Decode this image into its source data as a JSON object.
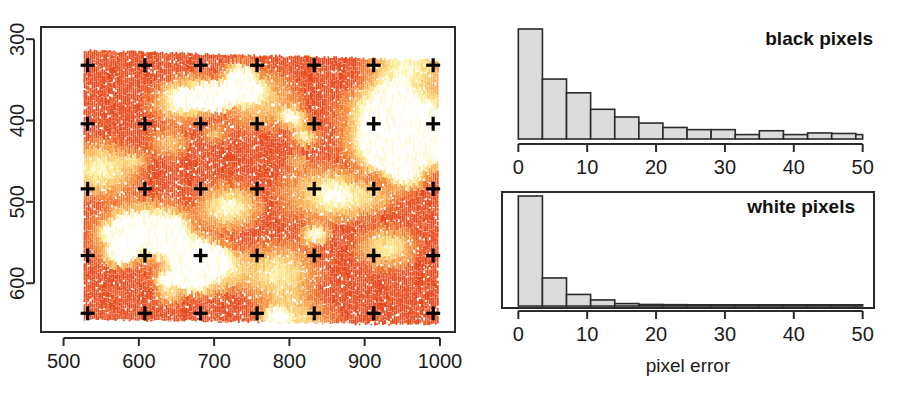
{
  "figure": {
    "background": "#ffffff",
    "width": 908,
    "height": 395
  },
  "chart_data": [
    {
      "id": "deformation-field",
      "type": "scatter",
      "title": "",
      "xlabel": "",
      "ylabel": "",
      "xlim": [
        470,
        1020
      ],
      "ylim": [
        660,
        285
      ],
      "y_inverted": true,
      "grid": false,
      "xticks": [
        500,
        600,
        700,
        800,
        900,
        1000
      ],
      "xticklabels": [
        "500",
        "600",
        "700",
        "800",
        "900",
        "1000"
      ],
      "yticks": [
        300,
        400,
        500,
        600
      ],
      "yticklabels": [
        "300",
        "400",
        "500",
        "600"
      ],
      "ytick_rotation": 90,
      "marker": "plus",
      "marker_color": "#000000",
      "description": "Dense orange-to-yellow vertical stroke texture (heat colormap) overlaid with a 7x5 grid of black plus markers",
      "colormap": [
        "#e8491e",
        "#f1702c",
        "#f68d3a",
        "#fbae52",
        "#fdd06e",
        "#fdf09a",
        "#ffffff"
      ],
      "marker_grid": {
        "cols": 7,
        "rows": 5,
        "x": [
          532,
          608,
          682,
          757,
          833,
          912,
          991
        ],
        "y": [
          332,
          404,
          484,
          566,
          637
        ]
      },
      "field_extent": {
        "x_min": 528,
        "x_max": 998,
        "y_min": 320,
        "y_max": 648
      }
    },
    {
      "id": "black-pixels-hist",
      "type": "bar",
      "title": "black pixels",
      "xlabel": "",
      "ylabel": "",
      "xlim": [
        -1.5,
        51.5
      ],
      "ylim": [
        0,
        1.0
      ],
      "grid": false,
      "box": false,
      "xticks": [
        0,
        10,
        20,
        30,
        40,
        50
      ],
      "xticklabels": [
        "0",
        "10",
        "20",
        "30",
        "40",
        "50"
      ],
      "bin_width": 3.5,
      "bin_edges": [
        0,
        3.5,
        7,
        10.5,
        14,
        17.5,
        21,
        24.5,
        28,
        31.5,
        35,
        38.5,
        42,
        45.5,
        49,
        50
      ],
      "categories": [
        "0-3.5",
        "3.5-7",
        "7-10.5",
        "10.5-14",
        "14-17.5",
        "17.5-21",
        "21-24.5",
        "24.5-28",
        "28-31.5",
        "31.5-35",
        "35-38.5",
        "38.5-42",
        "42-45.5",
        "45.5-49",
        "49-50"
      ],
      "values": [
        1.0,
        0.545,
        0.42,
        0.27,
        0.2,
        0.145,
        0.105,
        0.085,
        0.085,
        0.04,
        0.075,
        0.04,
        0.055,
        0.05,
        0.04
      ],
      "bar_fill": "#dcdcdc",
      "bar_stroke": "#2b2b2b"
    },
    {
      "id": "white-pixels-hist",
      "type": "bar",
      "title": "white pixels",
      "xlabel": "pixel error",
      "ylabel": "",
      "xlim": [
        -1.5,
        51.5
      ],
      "ylim": [
        0,
        1.0
      ],
      "grid": false,
      "box": true,
      "xticks": [
        0,
        10,
        20,
        30,
        40,
        50
      ],
      "xticklabels": [
        "0",
        "10",
        "20",
        "30",
        "40",
        "50"
      ],
      "bin_width": 3.5,
      "bin_edges": [
        0,
        3.5,
        7,
        10.5,
        14,
        17.5,
        21,
        24.5,
        28,
        31.5,
        35,
        38.5,
        42,
        45.5,
        49,
        50
      ],
      "categories": [
        "0-3.5",
        "3.5-7",
        "7-10.5",
        "10.5-14",
        "14-17.5",
        "17.5-21",
        "21-24.5",
        "24.5-28",
        "28-31.5",
        "31.5-35",
        "35-38.5",
        "38.5-42",
        "42-45.5",
        "45.5-49",
        "49-50"
      ],
      "values": [
        1.0,
        0.255,
        0.105,
        0.055,
        0.022,
        0.014,
        0.012,
        0.008,
        0.006,
        0.005,
        0.004,
        0.004,
        0.003,
        0.003,
        0.003
      ],
      "bar_fill": "#dcdcdc",
      "bar_stroke": "#2b2b2b"
    }
  ],
  "left_panel": {
    "xticklabels": [
      "500",
      "600",
      "700",
      "800",
      "900",
      "1000"
    ],
    "yticklabels": [
      "300",
      "400",
      "500",
      "600"
    ]
  },
  "top_right_panel": {
    "label": "black pixels",
    "xticklabels": [
      "0",
      "10",
      "20",
      "30",
      "40",
      "50"
    ]
  },
  "bottom_right_panel": {
    "label": "white pixels",
    "xticklabels": [
      "0",
      "10",
      "20",
      "30",
      "40",
      "50"
    ],
    "xlabel": "pixel error"
  }
}
